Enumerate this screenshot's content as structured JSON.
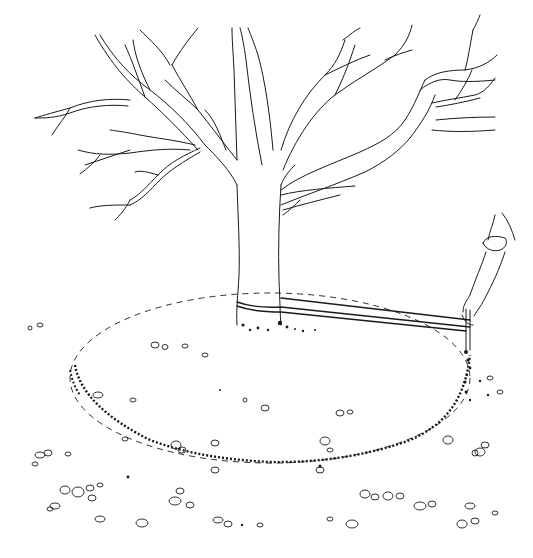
{
  "illustration": {
    "subject": "Line drawing of a bare tree with a rope looped around the trunk, pulled taut to a stake held by a hand that scribes a circle on the ground",
    "style": "black ink line art on white",
    "elements": [
      "tree-trunk",
      "branches",
      "rope",
      "hand-with-stake",
      "scribed-circle",
      "pebbles"
    ],
    "colors": {
      "ink": "#1a1a1a",
      "background": "#ffffff"
    }
  }
}
